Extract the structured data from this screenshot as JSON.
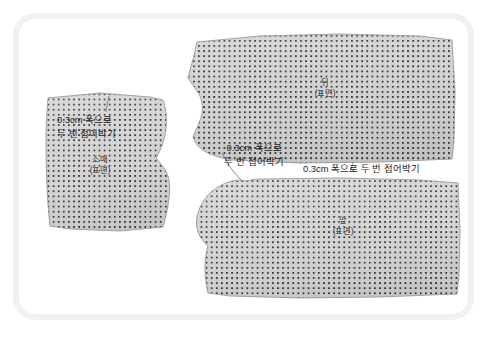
{
  "illustration": {
    "title": "sewing-pattern-fabric-pieces",
    "background_color": "#ffffff",
    "frame_color": "#f1f1f1",
    "fabric_base_color": "#d2d2d2",
    "fabric_dot_color": "#2e2e2e",
    "outline_color": "#8e8e8e",
    "text_color": "#1c1c1c"
  },
  "pieces": [
    {
      "id": "sleeve",
      "name_label": "소매",
      "side_label": "(표면)"
    },
    {
      "id": "back",
      "name_label": "뒤",
      "side_label": "(표면)"
    },
    {
      "id": "front",
      "name_label": "앞",
      "side_label": "(표면)"
    }
  ],
  "callouts": {
    "sleeve_hem": {
      "line1": "0.3cm 폭으로",
      "line2": "두 번 접어박기"
    },
    "neckline": {
      "line1": "0.3cm 폭으로",
      "line2": "두 번 접어박기"
    },
    "back_hem": {
      "line1": "0.3cm 폭으로 두 번 접어박기"
    }
  }
}
